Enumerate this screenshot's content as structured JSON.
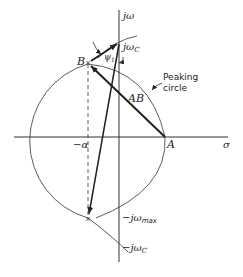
{
  "diagram": {
    "axes": {
      "imaginary_label": "jω",
      "real_label": "σ"
    },
    "points": {
      "A": "A",
      "B": "B",
      "neg_alpha": "−α",
      "j_omega_c": "jω",
      "j_omega_c_sub": "C",
      "neg_j_omega_max": "−jω",
      "neg_j_omega_max_sub": "max",
      "neg_j_omega_c": "−jω",
      "neg_j_omega_c_sub": "C"
    },
    "labels": {
      "AB": "AB",
      "psi": "ψ",
      "psi_sub": "1",
      "peaking_line1": "Peaking",
      "peaking_line2": "circle"
    }
  }
}
